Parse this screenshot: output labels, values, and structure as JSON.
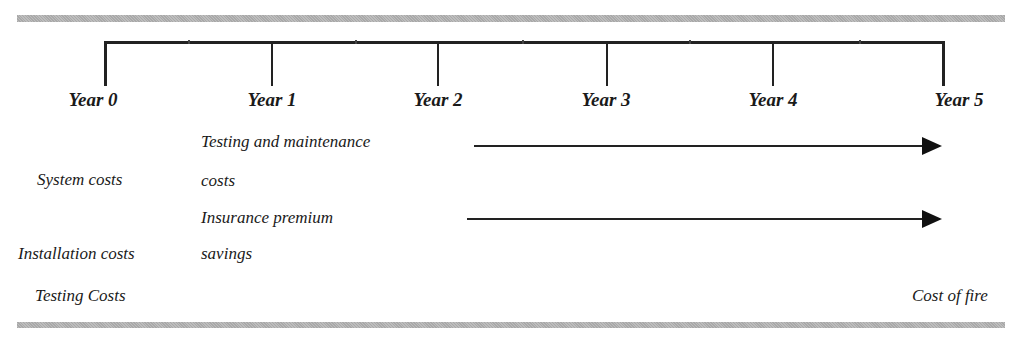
{
  "timeline": {
    "years": [
      "Year 0",
      "Year 1",
      "Year 2",
      "Year 3",
      "Year 4",
      "Year 5"
    ]
  },
  "year0_items": {
    "system_costs": "System costs",
    "installation_costs": "Installation costs",
    "testing_costs": "Testing Costs"
  },
  "recurring": {
    "testing_maintenance_line1": "Testing and maintenance",
    "testing_maintenance_line2": "costs",
    "insurance_line1": "Insurance premium",
    "insurance_line2": "savings"
  },
  "year5_items": {
    "cost_of_fire": "Cost of fire"
  }
}
